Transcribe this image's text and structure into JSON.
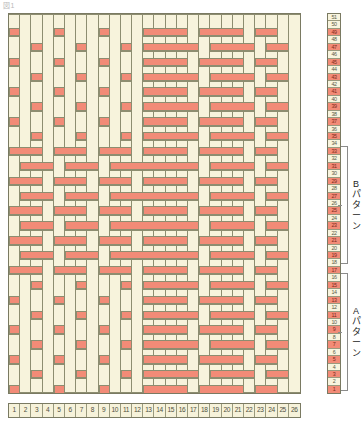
{
  "meta": {
    "corner_note": "図1",
    "grid_columns": 26,
    "grid_rows": 51,
    "color_cream": "#f7f3dc",
    "color_red": "#f28b77",
    "color_gridline": "#8d8d70",
    "color_border": "#7a7a62"
  },
  "column_numbers": [
    "1",
    "2",
    "3",
    "4",
    "5",
    "6",
    "7",
    "8",
    "9",
    "10",
    "11",
    "12",
    "13",
    "14",
    "15",
    "16",
    "17",
    "18",
    "19",
    "20",
    "21",
    "22",
    "23",
    "24",
    "25",
    "26"
  ],
  "row_numbers": [
    "51",
    "50",
    "49",
    "48",
    "47",
    "46",
    "45",
    "44",
    "43",
    "42",
    "41",
    "40",
    "39",
    "38",
    "37",
    "36",
    "35",
    "34",
    "33",
    "32",
    "31",
    "30",
    "29",
    "28",
    "27",
    "26",
    "25",
    "24",
    "23",
    "22",
    "21",
    "20",
    "19",
    "18",
    "17",
    "16",
    "15",
    "14",
    "13",
    "12",
    "11",
    "10",
    "9",
    "8",
    "7",
    "6",
    "5",
    "4",
    "3",
    "2",
    "1"
  ],
  "brackets": [
    {
      "name": "b-pattern",
      "label_lines": [
        "B",
        "パ",
        "タ",
        "ー",
        "ン"
      ],
      "top": 146,
      "height": 118
    },
    {
      "name": "a-pattern",
      "label_lines": [
        "A",
        "パ",
        "タ",
        "ー",
        "ン"
      ],
      "top": 273,
      "height": 118
    }
  ],
  "chart_data": {
    "type": "heatmap",
    "xlabel": "経糸 (warp) 番号",
    "ylabel": "緯糸 (weft) 段数",
    "categories_x": [
      "1",
      "2",
      "3",
      "4",
      "5",
      "6",
      "7",
      "8",
      "9",
      "10",
      "11",
      "12",
      "13",
      "14",
      "15",
      "16",
      "17",
      "18",
      "19",
      "20",
      "21",
      "22",
      "23",
      "24",
      "25",
      "26"
    ],
    "categories_y": [
      "51",
      "50",
      "49",
      "48",
      "47",
      "46",
      "45",
      "44",
      "43",
      "42",
      "41",
      "40",
      "39",
      "38",
      "37",
      "36",
      "35",
      "34",
      "33",
      "32",
      "31",
      "30",
      "29",
      "28",
      "27",
      "26",
      "25",
      "24",
      "23",
      "22",
      "21",
      "20",
      "19",
      "18",
      "17",
      "16",
      "15",
      "14",
      "13",
      "12",
      "11",
      "10",
      "9",
      "8",
      "7",
      "6",
      "5",
      "4",
      "3",
      "2",
      "1"
    ],
    "legend": [
      {
        "label": "cream / warp float",
        "color": "#f7f3dc",
        "value": 0
      },
      {
        "label": "red / weft float",
        "color": "#f28b77",
        "value": 1
      }
    ],
    "grid": true,
    "note": "1 = red (weft shown), 0 = cream (warp shown). Rows listed top (51) to bottom (1).",
    "values": [
      [
        0,
        0,
        0,
        0,
        0,
        0,
        0,
        0,
        0,
        0,
        0,
        0,
        0,
        0,
        0,
        0,
        0,
        0,
        0,
        0,
        0,
        0,
        0,
        0,
        0,
        0
      ],
      [
        0,
        0,
        0,
        0,
        0,
        0,
        0,
        0,
        0,
        0,
        0,
        0,
        0,
        0,
        0,
        0,
        0,
        0,
        0,
        0,
        0,
        0,
        0,
        0,
        0,
        0
      ],
      [
        1,
        0,
        0,
        0,
        1,
        0,
        0,
        0,
        1,
        0,
        0,
        0,
        1,
        1,
        1,
        1,
        0,
        1,
        1,
        1,
        1,
        0,
        1,
        1,
        0,
        0
      ],
      [
        0,
        0,
        0,
        0,
        0,
        0,
        0,
        0,
        0,
        0,
        0,
        0,
        0,
        0,
        0,
        0,
        0,
        0,
        0,
        0,
        0,
        0,
        0,
        0,
        0,
        0
      ],
      [
        0,
        0,
        1,
        0,
        0,
        0,
        1,
        0,
        0,
        0,
        1,
        0,
        1,
        1,
        1,
        1,
        1,
        0,
        1,
        1,
        1,
        1,
        0,
        1,
        1,
        0
      ],
      [
        0,
        0,
        0,
        0,
        0,
        0,
        0,
        0,
        0,
        0,
        0,
        0,
        0,
        0,
        0,
        0,
        0,
        0,
        0,
        0,
        0,
        0,
        0,
        0,
        0,
        0
      ],
      [
        1,
        0,
        0,
        0,
        1,
        0,
        0,
        0,
        1,
        0,
        0,
        0,
        1,
        1,
        1,
        1,
        0,
        1,
        1,
        1,
        1,
        0,
        1,
        1,
        0,
        0
      ],
      [
        0,
        0,
        0,
        0,
        0,
        0,
        0,
        0,
        0,
        0,
        0,
        0,
        0,
        0,
        0,
        0,
        0,
        0,
        0,
        0,
        0,
        0,
        0,
        0,
        0,
        0
      ],
      [
        0,
        0,
        1,
        0,
        0,
        0,
        1,
        0,
        0,
        0,
        1,
        0,
        1,
        1,
        1,
        1,
        1,
        0,
        1,
        1,
        1,
        1,
        0,
        1,
        1,
        0
      ],
      [
        0,
        0,
        0,
        0,
        0,
        0,
        0,
        0,
        0,
        0,
        0,
        0,
        0,
        0,
        0,
        0,
        0,
        0,
        0,
        0,
        0,
        0,
        0,
        0,
        0,
        0
      ],
      [
        1,
        0,
        0,
        0,
        1,
        0,
        0,
        0,
        1,
        0,
        0,
        0,
        1,
        1,
        1,
        1,
        0,
        1,
        1,
        1,
        1,
        0,
        1,
        1,
        0,
        0
      ],
      [
        0,
        0,
        0,
        0,
        0,
        0,
        0,
        0,
        0,
        0,
        0,
        0,
        0,
        0,
        0,
        0,
        0,
        0,
        0,
        0,
        0,
        0,
        0,
        0,
        0,
        0
      ],
      [
        0,
        0,
        1,
        0,
        0,
        0,
        1,
        0,
        0,
        0,
        1,
        0,
        1,
        1,
        1,
        1,
        1,
        0,
        1,
        1,
        1,
        1,
        0,
        1,
        1,
        0
      ],
      [
        0,
        0,
        0,
        0,
        0,
        0,
        0,
        0,
        0,
        0,
        0,
        0,
        0,
        0,
        0,
        0,
        0,
        0,
        0,
        0,
        0,
        0,
        0,
        0,
        0,
        0
      ],
      [
        1,
        0,
        0,
        0,
        1,
        0,
        0,
        0,
        1,
        0,
        0,
        0,
        1,
        1,
        1,
        1,
        0,
        1,
        1,
        1,
        1,
        0,
        1,
        1,
        0,
        0
      ],
      [
        0,
        0,
        0,
        0,
        0,
        0,
        0,
        0,
        0,
        0,
        0,
        0,
        0,
        0,
        0,
        0,
        0,
        0,
        0,
        0,
        0,
        0,
        0,
        0,
        0,
        0
      ],
      [
        0,
        0,
        1,
        0,
        0,
        0,
        1,
        0,
        0,
        0,
        1,
        0,
        1,
        1,
        1,
        1,
        1,
        0,
        1,
        1,
        1,
        1,
        0,
        1,
        1,
        0
      ],
      [
        0,
        0,
        0,
        0,
        0,
        0,
        0,
        0,
        0,
        0,
        0,
        0,
        0,
        0,
        0,
        0,
        0,
        0,
        0,
        0,
        0,
        0,
        0,
        0,
        0,
        0
      ],
      [
        1,
        1,
        1,
        0,
        1,
        1,
        1,
        0,
        1,
        1,
        1,
        0,
        1,
        1,
        1,
        1,
        0,
        1,
        1,
        1,
        1,
        0,
        1,
        1,
        0,
        0
      ],
      [
        0,
        0,
        0,
        0,
        0,
        0,
        0,
        0,
        0,
        0,
        0,
        0,
        0,
        0,
        0,
        0,
        0,
        0,
        0,
        0,
        0,
        0,
        0,
        0,
        0,
        0
      ],
      [
        0,
        1,
        1,
        1,
        0,
        1,
        1,
        1,
        0,
        1,
        1,
        1,
        1,
        1,
        1,
        1,
        1,
        0,
        1,
        1,
        1,
        1,
        0,
        1,
        1,
        0
      ],
      [
        0,
        0,
        0,
        0,
        0,
        0,
        0,
        0,
        0,
        0,
        0,
        0,
        0,
        0,
        0,
        0,
        0,
        0,
        0,
        0,
        0,
        0,
        0,
        0,
        0,
        0
      ],
      [
        1,
        1,
        1,
        0,
        1,
        1,
        1,
        0,
        1,
        1,
        1,
        0,
        1,
        1,
        1,
        1,
        0,
        1,
        1,
        1,
        1,
        0,
        1,
        1,
        0,
        0
      ],
      [
        0,
        0,
        0,
        0,
        0,
        0,
        0,
        0,
        0,
        0,
        0,
        0,
        0,
        0,
        0,
        0,
        0,
        0,
        0,
        0,
        0,
        0,
        0,
        0,
        0,
        0
      ],
      [
        0,
        1,
        1,
        1,
        0,
        1,
        1,
        1,
        0,
        1,
        1,
        1,
        1,
        1,
        1,
        1,
        1,
        0,
        1,
        1,
        1,
        1,
        0,
        1,
        1,
        0
      ],
      [
        0,
        0,
        0,
        0,
        0,
        0,
        0,
        0,
        0,
        0,
        0,
        0,
        0,
        0,
        0,
        0,
        0,
        0,
        0,
        0,
        0,
        0,
        0,
        0,
        0,
        0
      ],
      [
        1,
        1,
        1,
        0,
        1,
        1,
        1,
        0,
        1,
        1,
        1,
        0,
        1,
        1,
        1,
        1,
        0,
        1,
        1,
        1,
        1,
        0,
        1,
        1,
        0,
        0
      ],
      [
        0,
        0,
        0,
        0,
        0,
        0,
        0,
        0,
        0,
        0,
        0,
        0,
        0,
        0,
        0,
        0,
        0,
        0,
        0,
        0,
        0,
        0,
        0,
        0,
        0,
        0
      ],
      [
        0,
        1,
        1,
        1,
        0,
        1,
        1,
        1,
        0,
        1,
        1,
        1,
        1,
        1,
        1,
        1,
        1,
        0,
        1,
        1,
        1,
        1,
        0,
        1,
        1,
        0
      ],
      [
        0,
        0,
        0,
        0,
        0,
        0,
        0,
        0,
        0,
        0,
        0,
        0,
        0,
        0,
        0,
        0,
        0,
        0,
        0,
        0,
        0,
        0,
        0,
        0,
        0,
        0
      ],
      [
        1,
        1,
        1,
        0,
        1,
        1,
        1,
        0,
        1,
        1,
        1,
        0,
        1,
        1,
        1,
        1,
        0,
        1,
        1,
        1,
        1,
        0,
        1,
        1,
        0,
        0
      ],
      [
        0,
        0,
        0,
        0,
        0,
        0,
        0,
        0,
        0,
        0,
        0,
        0,
        0,
        0,
        0,
        0,
        0,
        0,
        0,
        0,
        0,
        0,
        0,
        0,
        0,
        0
      ],
      [
        0,
        1,
        1,
        1,
        0,
        1,
        1,
        1,
        0,
        1,
        1,
        1,
        1,
        1,
        1,
        1,
        1,
        0,
        1,
        1,
        1,
        1,
        0,
        1,
        1,
        0
      ],
      [
        0,
        0,
        0,
        0,
        0,
        0,
        0,
        0,
        0,
        0,
        0,
        0,
        0,
        0,
        0,
        0,
        0,
        0,
        0,
        0,
        0,
        0,
        0,
        0,
        0,
        0
      ],
      [
        1,
        1,
        1,
        0,
        1,
        1,
        1,
        0,
        1,
        1,
        1,
        0,
        1,
        1,
        1,
        1,
        0,
        1,
        1,
        1,
        1,
        0,
        1,
        1,
        0,
        0
      ],
      [
        0,
        0,
        0,
        0,
        0,
        0,
        0,
        0,
        0,
        0,
        0,
        0,
        0,
        0,
        0,
        0,
        0,
        0,
        0,
        0,
        0,
        0,
        0,
        0,
        0,
        0
      ],
      [
        0,
        0,
        1,
        0,
        0,
        0,
        1,
        0,
        0,
        0,
        1,
        0,
        1,
        1,
        1,
        1,
        1,
        0,
        1,
        1,
        1,
        1,
        0,
        1,
        1,
        0
      ],
      [
        0,
        0,
        0,
        0,
        0,
        0,
        0,
        0,
        0,
        0,
        0,
        0,
        0,
        0,
        0,
        0,
        0,
        0,
        0,
        0,
        0,
        0,
        0,
        0,
        0,
        0
      ],
      [
        1,
        0,
        0,
        0,
        1,
        0,
        0,
        0,
        1,
        0,
        0,
        0,
        1,
        1,
        1,
        1,
        0,
        1,
        1,
        1,
        1,
        0,
        1,
        1,
        0,
        0
      ],
      [
        0,
        0,
        0,
        0,
        0,
        0,
        0,
        0,
        0,
        0,
        0,
        0,
        0,
        0,
        0,
        0,
        0,
        0,
        0,
        0,
        0,
        0,
        0,
        0,
        0,
        0
      ],
      [
        0,
        0,
        1,
        0,
        0,
        0,
        1,
        0,
        0,
        0,
        1,
        0,
        1,
        1,
        1,
        1,
        1,
        0,
        1,
        1,
        1,
        1,
        0,
        1,
        1,
        0
      ],
      [
        0,
        0,
        0,
        0,
        0,
        0,
        0,
        0,
        0,
        0,
        0,
        0,
        0,
        0,
        0,
        0,
        0,
        0,
        0,
        0,
        0,
        0,
        0,
        0,
        0,
        0
      ],
      [
        1,
        0,
        0,
        0,
        1,
        0,
        0,
        0,
        1,
        0,
        0,
        0,
        1,
        1,
        1,
        1,
        0,
        1,
        1,
        1,
        1,
        0,
        1,
        1,
        0,
        0
      ],
      [
        0,
        0,
        0,
        0,
        0,
        0,
        0,
        0,
        0,
        0,
        0,
        0,
        0,
        0,
        0,
        0,
        0,
        0,
        0,
        0,
        0,
        0,
        0,
        0,
        0,
        0
      ],
      [
        0,
        0,
        1,
        0,
        0,
        0,
        1,
        0,
        0,
        0,
        1,
        0,
        1,
        1,
        1,
        1,
        1,
        0,
        1,
        1,
        1,
        1,
        0,
        1,
        1,
        0
      ],
      [
        0,
        0,
        0,
        0,
        0,
        0,
        0,
        0,
        0,
        0,
        0,
        0,
        0,
        0,
        0,
        0,
        0,
        0,
        0,
        0,
        0,
        0,
        0,
        0,
        0,
        0
      ],
      [
        1,
        0,
        0,
        0,
        1,
        0,
        0,
        0,
        1,
        0,
        0,
        0,
        1,
        1,
        1,
        1,
        0,
        1,
        1,
        1,
        1,
        0,
        1,
        1,
        0,
        0
      ],
      [
        0,
        0,
        0,
        0,
        0,
        0,
        0,
        0,
        0,
        0,
        0,
        0,
        0,
        0,
        0,
        0,
        0,
        0,
        0,
        0,
        0,
        0,
        0,
        0,
        0,
        0
      ],
      [
        0,
        0,
        1,
        0,
        0,
        0,
        1,
        0,
        0,
        0,
        1,
        0,
        1,
        1,
        1,
        1,
        1,
        0,
        1,
        1,
        1,
        1,
        0,
        1,
        1,
        0
      ],
      [
        0,
        0,
        0,
        0,
        0,
        0,
        0,
        0,
        0,
        0,
        0,
        0,
        0,
        0,
        0,
        0,
        0,
        0,
        0,
        0,
        0,
        0,
        0,
        0,
        0,
        0
      ],
      [
        1,
        0,
        0,
        0,
        1,
        0,
        0,
        0,
        1,
        0,
        0,
        0,
        1,
        1,
        1,
        1,
        0,
        1,
        1,
        1,
        1,
        0,
        1,
        1,
        0,
        0
      ]
    ],
    "row_number_highlight": [
      0,
      0,
      1,
      0,
      1,
      0,
      1,
      0,
      1,
      0,
      1,
      0,
      1,
      0,
      1,
      0,
      1,
      0,
      1,
      0,
      1,
      0,
      1,
      0,
      1,
      0,
      1,
      0,
      1,
      0,
      1,
      0,
      1,
      0,
      1,
      0,
      1,
      0,
      1,
      0,
      1,
      0,
      1,
      0,
      1,
      0,
      1,
      0,
      1,
      0,
      1
    ]
  }
}
